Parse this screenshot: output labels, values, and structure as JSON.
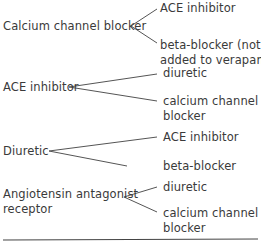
{
  "groups": [
    {
      "source": "Calcium channel blocker",
      "targets": [
        "ACE inhibitor",
        "beta-blocker (not",
        "added to verapamil)"
      ]
    },
    {
      "source": "ACE inhibitor",
      "targets": [
        "diuretic",
        "calcium channel",
        "blocker"
      ]
    },
    {
      "source": "Diuretic",
      "targets": [
        "ACE inhibitor",
        "beta-blocker"
      ]
    },
    {
      "source": "Angiotensin antagonist",
      "source_line2": "receptor",
      "targets": [
        "diuretic",
        "calcium channel",
        "blocker"
      ]
    }
  ],
  "colors": {
    "text": "#3a3a3a",
    "line": "#555555"
  }
}
